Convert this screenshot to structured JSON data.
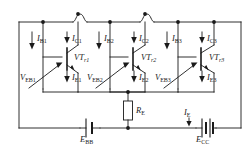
{
  "figure": {
    "kind": "circuit-schematic",
    "line_color": "#1a1a1a",
    "background": "#ffffff"
  },
  "transistors": [
    {
      "name": "VT1",
      "label_main": "VT",
      "label_sub": "r1"
    },
    {
      "name": "VT2",
      "label_main": "VT",
      "label_sub": "r2"
    },
    {
      "name": "VT3",
      "label_main": "VT",
      "label_sub": "r3"
    }
  ],
  "currents": {
    "base": [
      {
        "main": "I",
        "sub": "B1"
      },
      {
        "main": "I",
        "sub": "B2"
      },
      {
        "main": "I",
        "sub": "B3"
      }
    ],
    "collector": [
      {
        "main": "I",
        "sub": "C1"
      },
      {
        "main": "I",
        "sub": "C2"
      },
      {
        "main": "I",
        "sub": "C3"
      }
    ],
    "emitter": [
      {
        "main": "I",
        "sub": "E1"
      },
      {
        "main": "I",
        "sub": "E2"
      },
      {
        "main": "I",
        "sub": "E3"
      }
    ],
    "total_emitter": {
      "main": "I",
      "sub": "E"
    }
  },
  "voltages": [
    {
      "main": "V",
      "sub": "EB1"
    },
    {
      "main": "V",
      "sub": "EB2"
    },
    {
      "main": "V",
      "sub": "EB3"
    }
  ],
  "components": {
    "resistor": {
      "main": "R",
      "sub": "E"
    },
    "supply_base": {
      "main": "E",
      "sub": "BB"
    },
    "supply_collector": {
      "main": "E",
      "sub": "CC"
    }
  }
}
